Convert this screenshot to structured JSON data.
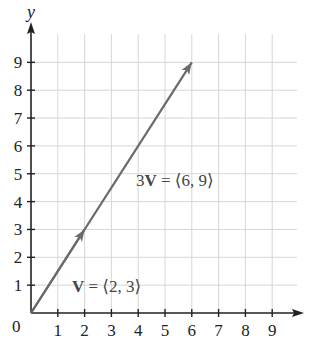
{
  "chart_data": {
    "type": "line",
    "title": "",
    "xlabel": "",
    "ylabel": "y",
    "origin_label": "0",
    "x_ticks": [
      "1",
      "2",
      "3",
      "4",
      "5",
      "6",
      "7",
      "8",
      "9"
    ],
    "y_ticks": [
      "1",
      "2",
      "3",
      "4",
      "5",
      "6",
      "7",
      "8",
      "9"
    ],
    "xlim": [
      0,
      10
    ],
    "ylim": [
      0,
      10
    ],
    "grid": true,
    "series": [
      {
        "name": "V",
        "label_prefix": "V",
        "label_suffix": " = ⟨2, 3⟩",
        "from": [
          0,
          0
        ],
        "to": [
          2,
          3
        ]
      },
      {
        "name": "3V",
        "label_prefix": "3V",
        "label_suffix": " = ⟨6, 9⟩",
        "from": [
          0,
          0
        ],
        "to": [
          6,
          9
        ]
      }
    ]
  },
  "labels": {
    "y_axis": "y",
    "origin": "0",
    "v_bold": "V",
    "v_rest": " = ⟨2, 3⟩",
    "v3_num": "3",
    "v3_bold": "V",
    "v3_rest": " = ⟨6, 9⟩"
  },
  "colors": {
    "axis": "#222222",
    "grid": "#d6d6d6",
    "vector": "#6a6a6a",
    "label": "#444444"
  }
}
